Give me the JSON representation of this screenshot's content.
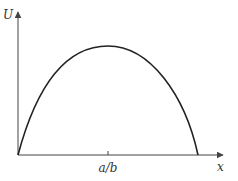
{
  "diagram": {
    "y_axis_label": "U",
    "x_axis_label": "x",
    "tick_label": "a/b",
    "line_color": "#222222",
    "axis_color": "#444444"
  }
}
